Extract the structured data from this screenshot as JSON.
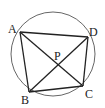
{
  "diagram": {
    "type": "cyclic-quadrilateral",
    "circle": {
      "cx": 53,
      "cy": 54,
      "r": 42,
      "stroke": "#555555"
    },
    "points": {
      "A": {
        "x": 20,
        "y": 32
      },
      "B": {
        "x": 29,
        "y": 92
      },
      "C": {
        "x": 83,
        "y": 86
      },
      "D": {
        "x": 88,
        "y": 37
      },
      "P": {
        "x": 59,
        "y": 64
      }
    },
    "labels": {
      "A": "A",
      "B": "B",
      "C": "C",
      "D": "D",
      "P": "P"
    },
    "segments": [
      [
        "A",
        "D"
      ],
      [
        "D",
        "C"
      ],
      [
        "C",
        "B"
      ],
      [
        "B",
        "A"
      ],
      [
        "A",
        "C"
      ],
      [
        "B",
        "D"
      ]
    ],
    "line_color": "#222222"
  }
}
